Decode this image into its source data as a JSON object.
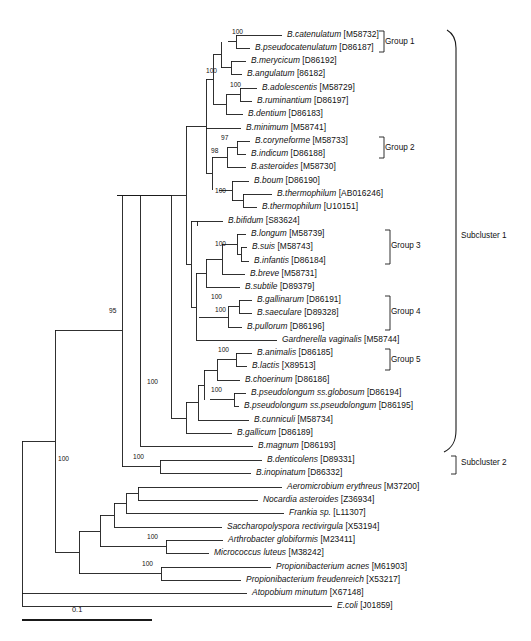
{
  "figure": {
    "type": "phylogenetic-tree",
    "scale_bar": {
      "label": "0.1",
      "value": 0.1
    }
  },
  "taxa": [
    {
      "name": "B.catenulatum",
      "accession": "[M58732]",
      "y": 35
    },
    {
      "name": "B.pseudocatenulatum",
      "accession": "[D86187]",
      "y": 48
    },
    {
      "name": "B.merycicum",
      "accession": "[D86192]",
      "y": 61
    },
    {
      "name": "B.angulatum",
      "accession": "[86182]",
      "y": 74
    },
    {
      "name": "B.adolescentis",
      "accession": "[M58729]",
      "y": 88
    },
    {
      "name": "B.ruminantium",
      "accession": "[D86197]",
      "y": 101
    },
    {
      "name": "B.dentium",
      "accession": "[D86183]",
      "y": 114
    },
    {
      "name": "B.minimum",
      "accession": "[M58741]",
      "y": 128
    },
    {
      "name": "B.coryneforme",
      "accession": "[M58733]",
      "y": 141
    },
    {
      "name": "B.indicum",
      "accession": "[D86188]",
      "y": 154
    },
    {
      "name": "B.asteroides",
      "accession": "[M58730]",
      "y": 167
    },
    {
      "name": "B.boum",
      "accession": "[D86190]",
      "y": 181
    },
    {
      "name": "B.thermophilum",
      "accession": "[AB016246]",
      "y": 194
    },
    {
      "name": "B.thermophilum",
      "accession": "[U10151]",
      "y": 207
    },
    {
      "name": "B.bifidum",
      "accession": "[S83624]",
      "y": 221
    },
    {
      "name": "B.longum",
      "accession": "[M58739]",
      "y": 234
    },
    {
      "name": "B.suis",
      "accession": "[M58743]",
      "y": 247
    },
    {
      "name": "B.infantis",
      "accession": "[D86184]",
      "y": 261
    },
    {
      "name": "B.breve",
      "accession": "[M58731]",
      "y": 274
    },
    {
      "name": "B.subtile",
      "accession": "[D89379]",
      "y": 287
    },
    {
      "name": "B.gallinarum",
      "accession": "[D86191]",
      "y": 300
    },
    {
      "name": "B.saeculare",
      "accession": "[D89328]",
      "y": 313
    },
    {
      "name": "B.pullorum",
      "accession": "[D86196]",
      "y": 327
    },
    {
      "name": "Gardnerella vaginalis",
      "accession": "[M58744]",
      "y": 340
    },
    {
      "name": "B.animalis",
      "accession": "[D86185]",
      "y": 353
    },
    {
      "name": "B.lactis",
      "accession": "[X89513]",
      "y": 366
    },
    {
      "name": "B.choerinum",
      "accession": "[D86186]",
      "y": 380
    },
    {
      "name": "B.pseudolongum ss.globosum",
      "accession": "[D86194]",
      "y": 393
    },
    {
      "name": "B.pseudolongum ss.pseudolongum",
      "accession": "[D86195]",
      "y": 406
    },
    {
      "name": "B.cunniculi",
      "accession": "[M58734]",
      "y": 420
    },
    {
      "name": "B.gallicum",
      "accession": "[D86189]",
      "y": 433
    },
    {
      "name": "B.magnum",
      "accession": "[D86193]",
      "y": 446
    },
    {
      "name": "B.denticolens",
      "accession": "[D89331]",
      "y": 460
    },
    {
      "name": "B.inopinatum",
      "accession": "[D86332]",
      "y": 473
    },
    {
      "name": "Aeromicrobium erythreus",
      "accession": "[M37200]",
      "y": 487
    },
    {
      "name": "Nocardia asteroides",
      "accession": "[Z36934]",
      "y": 500
    },
    {
      "name": "Frankia sp.",
      "accession": "[L11307]",
      "y": 513
    },
    {
      "name": "Saccharopolyspora rectivirgula",
      "accession": "[X53194]",
      "y": 527
    },
    {
      "name": "Arthrobacter globiformis",
      "accession": "[M23411]",
      "y": 540
    },
    {
      "name": "Micrococcus luteus",
      "accession": "[M38242]",
      "y": 553
    },
    {
      "name": "Propionibacterium acnes",
      "accession": "[M61903]",
      "y": 567
    },
    {
      "name": "Propionibacterium freudenreich",
      "accession": "[X53217]",
      "y": 580
    },
    {
      "name": "Atopobium minutum",
      "accession": "[X67148]",
      "y": 593
    },
    {
      "name": "E.coli",
      "accession": "[J01859]",
      "y": 606
    }
  ],
  "bootstrap_values": [
    {
      "value": "100",
      "x": 232,
      "y": 28
    },
    {
      "value": "100",
      "x": 206,
      "y": 67
    },
    {
      "value": "100",
      "x": 230,
      "y": 81
    },
    {
      "value": "97",
      "x": 221,
      "y": 134
    },
    {
      "value": "98",
      "x": 211,
      "y": 147
    },
    {
      "value": "100",
      "x": 215,
      "y": 187
    },
    {
      "value": "100",
      "x": 215,
      "y": 240
    },
    {
      "value": "100",
      "x": 211,
      "y": 293
    },
    {
      "value": "100",
      "x": 215,
      "y": 306
    },
    {
      "value": "100",
      "x": 218,
      "y": 346
    },
    {
      "value": "100",
      "x": 211,
      "y": 386
    },
    {
      "value": "95",
      "x": 109,
      "y": 307
    },
    {
      "value": "100",
      "x": 147,
      "y": 378
    },
    {
      "value": "100",
      "x": 58,
      "y": 455
    },
    {
      "value": "100",
      "x": 133,
      "y": 453
    },
    {
      "value": "100",
      "x": 147,
      "y": 533
    },
    {
      "value": "100",
      "x": 142,
      "y": 560
    }
  ],
  "groups": [
    {
      "label": "Group 1",
      "top": 31,
      "bottom": 52,
      "x": 383,
      "label_y": 38
    },
    {
      "label": "Group 2",
      "top": 137,
      "bottom": 158,
      "x": 383,
      "label_y": 144
    },
    {
      "label": "Group 3",
      "top": 230,
      "bottom": 264,
      "x": 389,
      "label_y": 242
    },
    {
      "label": "Group 4",
      "top": 296,
      "bottom": 330,
      "x": 389,
      "label_y": 308
    },
    {
      "label": "Group 5",
      "top": 349,
      "bottom": 370,
      "x": 389,
      "label_y": 356
    }
  ],
  "subclusters": [
    {
      "label": "Subcluster 1",
      "top": 30,
      "bottom": 450,
      "x": 457,
      "label_y": 235
    },
    {
      "label": "Subcluster 2",
      "top": 456,
      "bottom": 477,
      "x": 457,
      "label_y": 462
    }
  ]
}
